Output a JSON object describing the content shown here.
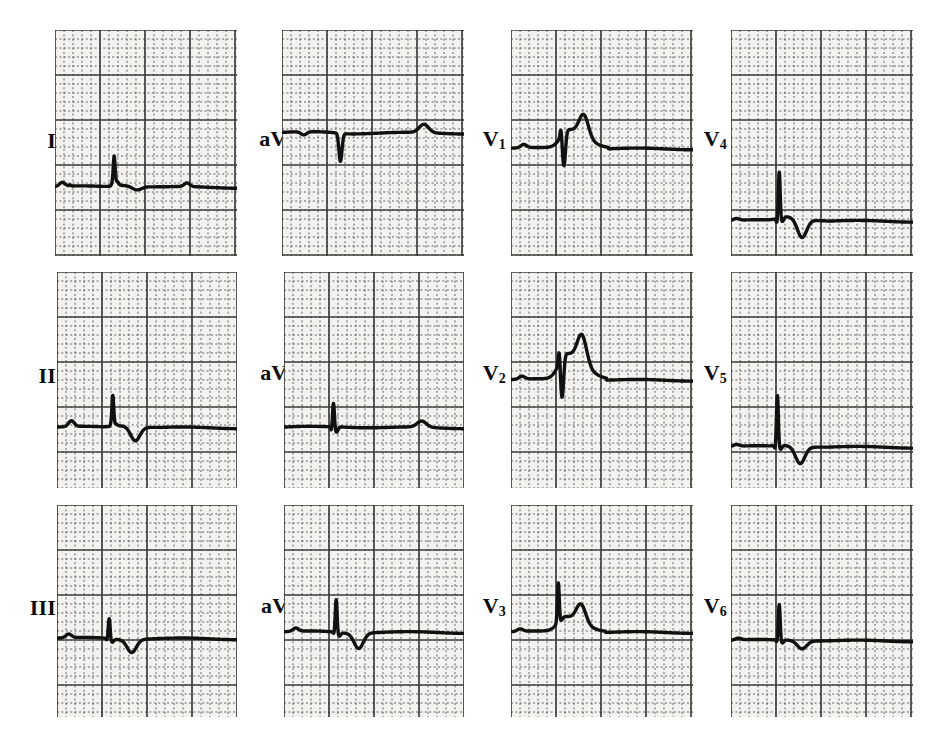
{
  "figure": {
    "type": "12-lead-ecg",
    "title": "",
    "caption_partial": "",
    "background_color": "#ffffff",
    "paper_color": "#f4f2ef",
    "grid_color": "#3b3b3b",
    "trace_color": "#111111"
  },
  "grid": {
    "small_box_px": 9,
    "large_box_every": 5,
    "small_box_mm": 1,
    "large_box_mm": 5,
    "paper_speed": "25 mm/s",
    "calibration": "10 mm/mV"
  },
  "layout": {
    "rows": 3,
    "columns": 4,
    "column_order": [
      "limb",
      "augmented",
      "precordial-anterior",
      "precordial-lateral"
    ]
  },
  "leads": [
    {
      "id": "I",
      "label_main": "I",
      "label_sub": "",
      "row": 0,
      "col": 0,
      "label_x": 22,
      "label_y": 130,
      "label_w": 34,
      "strip_x": 55,
      "strip_y": 30,
      "strip_w": 182,
      "strip_h": 226,
      "baseline_frac": 0.695,
      "beats": [
        {
          "t": 0.095,
          "p": 0.22,
          "q": 0.06,
          "r": 0.0,
          "s": 0.0,
          "st": 0.0,
          "t_amp": 0.0,
          "kind": "p-only"
        },
        {
          "t": 0.325,
          "p": 0.0,
          "q": 0.1,
          "r": 1.62,
          "s": 0.22,
          "st": 0.1,
          "t_amp": -0.2,
          "kind": "qrs"
        },
        {
          "t": 0.78,
          "p": 0.2,
          "q": 0.0,
          "r": 0.0,
          "s": 0.0,
          "st": 0.0,
          "t_amp": 0.0,
          "kind": "p-only"
        }
      ],
      "reading": "low-voltage R with slight ST change, flat baseline"
    },
    {
      "id": "aVR",
      "label_main": "aV",
      "label_sub": "R",
      "row": 0,
      "col": 1,
      "label_x": 237,
      "label_y": 128,
      "label_w": 62,
      "strip_x": 282,
      "strip_y": 30,
      "strip_w": 182,
      "strip_h": 226,
      "baseline_frac": 0.455,
      "beats": [
        {
          "t": 0.175,
          "p": -0.18,
          "q": 0.0,
          "r": 0.0,
          "s": 0.0,
          "st": 0.0,
          "t_amp": 0.0,
          "kind": "p-neg"
        },
        {
          "t": 0.305,
          "p": 0.0,
          "q": 0.0,
          "r": 0.05,
          "s": -1.55,
          "st": -0.05,
          "t_amp": 0.0,
          "kind": "qs-deep"
        },
        {
          "t": 0.655,
          "p": 0.0,
          "q": 0.0,
          "r": 0.0,
          "s": 0.0,
          "st": 0.0,
          "t_amp": 0.46,
          "kind": "t-pos"
        }
      ],
      "reading": "deep QS complex, upright T"
    },
    {
      "id": "V1",
      "label_main": "V",
      "label_sub": "1",
      "row": 0,
      "col": 2,
      "label_x": 462,
      "label_y": 128,
      "label_w": 44,
      "strip_x": 511,
      "strip_y": 30,
      "strip_w": 182,
      "strip_h": 226,
      "baseline_frac": 0.525,
      "beats": [
        {
          "t": 0.125,
          "p": 0.18,
          "q": 0.0,
          "r": 0.0,
          "s": 0.0,
          "st": 0.0,
          "t_amp": 0.0,
          "kind": "p-only"
        },
        {
          "t": 0.275,
          "p": 0.0,
          "q": 0.0,
          "r": 0.62,
          "s": -1.85,
          "st": 1.05,
          "t_amp": 1.2,
          "kind": "rs-ste"
        }
      ],
      "reading": "rS with marked ST elevation and large coved T"
    },
    {
      "id": "V4",
      "label_main": "V",
      "label_sub": "4",
      "row": 0,
      "col": 3,
      "label_x": 683,
      "label_y": 128,
      "label_w": 44,
      "strip_x": 731,
      "strip_y": 30,
      "strip_w": 182,
      "strip_h": 226,
      "baseline_frac": 0.845,
      "beats": [
        {
          "t": 0.085,
          "p": 0.1,
          "q": 0.0,
          "r": 0.0,
          "s": 0.0,
          "st": 0.0,
          "t_amp": 0.0,
          "kind": "p-only"
        },
        {
          "t": 0.265,
          "p": 0.0,
          "q": -0.3,
          "r": 2.6,
          "s": -0.25,
          "st": 0.22,
          "t_amp": -1.05,
          "kind": "spike-tneg"
        }
      ],
      "reading": "tall narrow spike, ST-T with deep negative T"
    },
    {
      "id": "II",
      "label_main": "II",
      "label_sub": "",
      "row": 1,
      "col": 0,
      "label_x": 16,
      "label_y": 365,
      "label_w": 40,
      "strip_x": 57,
      "strip_y": 272,
      "strip_w": 180,
      "strip_h": 216,
      "baseline_frac": 0.72,
      "beats": [
        {
          "t": 0.135,
          "p": 0.32,
          "q": 0.0,
          "r": 0.0,
          "s": 0.0,
          "st": 0.0,
          "t_amp": 0.0,
          "kind": "p-only"
        },
        {
          "t": 0.31,
          "p": 0.0,
          "q": 0.05,
          "r": 1.7,
          "s": 0.1,
          "st": 0.1,
          "t_amp": -0.78,
          "kind": "qrs-tneg"
        }
      ],
      "reading": "R spike with deep symmetric T inversion"
    },
    {
      "id": "aVL",
      "label_main": "aV",
      "label_sub": "L",
      "row": 1,
      "col": 1,
      "label_x": 237,
      "label_y": 362,
      "label_w": 62,
      "strip_x": 284,
      "strip_y": 272,
      "strip_w": 180,
      "strip_h": 216,
      "baseline_frac": 0.72,
      "beats": [
        {
          "t": 0.275,
          "p": 0.0,
          "q": -0.22,
          "r": 1.35,
          "s": -0.3,
          "st": 0.02,
          "t_amp": 0.0,
          "kind": "spike"
        },
        {
          "t": 0.64,
          "p": 0.0,
          "q": 0.0,
          "r": 0.0,
          "s": 0.0,
          "st": 0.0,
          "t_amp": 0.34,
          "kind": "t-pos"
        }
      ],
      "reading": "narrow spike, low amplitude, small upright T"
    },
    {
      "id": "V2",
      "label_main": "V",
      "label_sub": "2",
      "row": 1,
      "col": 2,
      "label_x": 462,
      "label_y": 362,
      "label_w": 44,
      "strip_x": 511,
      "strip_y": 272,
      "strip_w": 182,
      "strip_h": 216,
      "baseline_frac": 0.5,
      "beats": [
        {
          "t": 0.115,
          "p": 0.16,
          "q": 0.0,
          "r": 0.0,
          "s": 0.0,
          "st": 0.0,
          "t_amp": 0.0,
          "kind": "p-only"
        },
        {
          "t": 0.265,
          "p": 0.0,
          "q": 0.0,
          "r": 0.92,
          "s": -2.2,
          "st": 1.45,
          "t_amp": 1.55,
          "kind": "rs-ste-giant"
        }
      ],
      "reading": "deep S with giant coved ST elevation, reciprocal dip"
    },
    {
      "id": "V5",
      "label_main": "V",
      "label_sub": "5",
      "row": 1,
      "col": 3,
      "label_x": 683,
      "label_y": 362,
      "label_w": 44,
      "strip_x": 731,
      "strip_y": 272,
      "strip_w": 182,
      "strip_h": 216,
      "baseline_frac": 0.81,
      "beats": [
        {
          "t": 0.085,
          "p": 0.1,
          "q": 0.0,
          "r": 0.0,
          "s": 0.0,
          "st": 0.0,
          "t_amp": 0.0,
          "kind": "p-only"
        },
        {
          "t": 0.255,
          "p": 0.0,
          "q": -0.2,
          "r": 2.85,
          "s": -0.22,
          "st": 0.06,
          "t_amp": -0.95,
          "kind": "spike-tneg"
        }
      ],
      "reading": "very tall narrow spike with deep inverted T"
    },
    {
      "id": "III",
      "label_main": "III",
      "label_sub": "",
      "row": 2,
      "col": 0,
      "label_x": 10,
      "label_y": 597,
      "label_w": 46,
      "strip_x": 57,
      "strip_y": 505,
      "strip_w": 180,
      "strip_h": 212,
      "baseline_frac": 0.63,
      "beats": [
        {
          "t": 0.12,
          "p": 0.2,
          "q": 0.0,
          "r": 0.0,
          "s": 0.0,
          "st": 0.0,
          "t_amp": 0.0,
          "kind": "p-only"
        },
        {
          "t": 0.29,
          "p": 0.0,
          "q": -0.12,
          "r": 1.15,
          "s": -0.18,
          "st": -0.05,
          "t_amp": -0.72,
          "kind": "qrs-tneg"
        }
      ],
      "reading": "small R, broad inverted T"
    },
    {
      "id": "aVF",
      "label_main": "aV",
      "label_sub": "F",
      "row": 2,
      "col": 1,
      "label_x": 237,
      "label_y": 595,
      "label_w": 62,
      "strip_x": 284,
      "strip_y": 505,
      "strip_w": 180,
      "strip_h": 212,
      "baseline_frac": 0.6,
      "beats": [
        {
          "t": 0.12,
          "p": 0.18,
          "q": 0.0,
          "r": 0.0,
          "s": 0.0,
          "st": 0.0,
          "t_amp": 0.0,
          "kind": "p-only"
        },
        {
          "t": 0.29,
          "p": 0.0,
          "q": -0.12,
          "r": 1.85,
          "s": -0.2,
          "st": -0.05,
          "t_amp": -0.85,
          "kind": "qrs-tneg"
        }
      ],
      "reading": "R spike with deep inverted T"
    },
    {
      "id": "V3",
      "label_main": "V",
      "label_sub": "3",
      "row": 2,
      "col": 2,
      "label_x": 462,
      "label_y": 595,
      "label_w": 44,
      "strip_x": 511,
      "strip_y": 505,
      "strip_w": 182,
      "strip_h": 212,
      "baseline_frac": 0.6,
      "beats": [
        {
          "t": 0.105,
          "p": 0.14,
          "q": 0.0,
          "r": 0.0,
          "s": 0.0,
          "st": 0.0,
          "t_amp": 0.0,
          "kind": "p-only"
        },
        {
          "t": 0.26,
          "p": 0.0,
          "q": 0.0,
          "r": 2.2,
          "s": -0.1,
          "st": 0.85,
          "t_amp": 1.0,
          "kind": "r-ste-dip"
        }
      ],
      "reading": "tall R, ST elevation then sharp negative deflection"
    },
    {
      "id": "V6",
      "label_main": "V",
      "label_sub": "6",
      "row": 2,
      "col": 3,
      "label_x": 683,
      "label_y": 595,
      "label_w": 44,
      "strip_x": 731,
      "strip_y": 505,
      "strip_w": 182,
      "strip_h": 212,
      "baseline_frac": 0.64,
      "beats": [
        {
          "t": 0.095,
          "p": 0.1,
          "q": 0.0,
          "r": 0.0,
          "s": 0.0,
          "st": 0.0,
          "t_amp": 0.0,
          "kind": "p-only"
        },
        {
          "t": 0.265,
          "p": 0.0,
          "q": -0.15,
          "r": 2.0,
          "s": -0.18,
          "st": 0.02,
          "t_amp": -0.45,
          "kind": "spike-tneg"
        }
      ],
      "reading": "narrow tall spike, shallow inverted T"
    }
  ],
  "chart_data": {
    "type": "line",
    "xlabel": "time",
    "ylabel": "voltage",
    "grid": true,
    "legend": "none",
    "series": [
      {
        "name": "I",
        "reading": "low-voltage R, minor ST change"
      },
      {
        "name": "aVR",
        "reading": "deep QS, upright T"
      },
      {
        "name": "V1",
        "reading": "rS with ST elevation, coved T"
      },
      {
        "name": "V4",
        "reading": "narrow spike, deep T inversion"
      },
      {
        "name": "II",
        "reading": "R spike, deep inverted T"
      },
      {
        "name": "aVL",
        "reading": "narrow spike, small upright T"
      },
      {
        "name": "V2",
        "reading": "deep S, giant ST elevation"
      },
      {
        "name": "V5",
        "reading": "tall spike, deep inverted T"
      },
      {
        "name": "III",
        "reading": "small R, broad inverted T"
      },
      {
        "name": "aVF",
        "reading": "R spike, deep inverted T"
      },
      {
        "name": "V3",
        "reading": "tall R, ST elevation with sharp dip"
      },
      {
        "name": "V6",
        "reading": "narrow spike, shallow inverted T"
      }
    ]
  }
}
